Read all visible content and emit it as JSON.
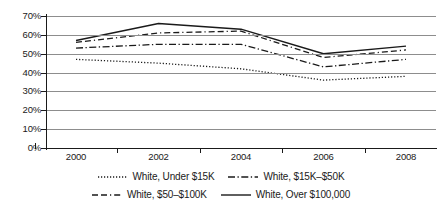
{
  "chart_data": {
    "type": "line",
    "title": "",
    "xlabel": "",
    "ylabel": "",
    "categories": [
      "2000",
      "2002",
      "2004",
      "2006",
      "2008"
    ],
    "x": [
      2000,
      2002,
      2004,
      2006,
      2008
    ],
    "ylim": [
      0,
      70
    ],
    "ytick_labels": [
      "0%",
      "10%",
      "20%",
      "30%",
      "40%",
      "50%",
      "60%",
      "70%"
    ],
    "ytick_values": [
      0,
      10,
      20,
      30,
      40,
      50,
      60,
      70
    ],
    "grid": true,
    "legend_position": "bottom",
    "series": [
      {
        "name": "White, Under $15K",
        "values": [
          47,
          45,
          42,
          36,
          38
        ],
        "style": "dotted",
        "color": "#1a1a1a"
      },
      {
        "name": "White, $15K–$50K",
        "values": [
          53,
          55,
          55,
          43,
          47
        ],
        "style": "dashdot",
        "color": "#1a1a1a"
      },
      {
        "name": "White, $50–$100K",
        "values": [
          56,
          61,
          62,
          48,
          52
        ],
        "style": "dashed",
        "color": "#1a1a1a"
      },
      {
        "name": "White, Over $100,000",
        "values": [
          57,
          66,
          63,
          50,
          54
        ],
        "style": "solid",
        "color": "#1a1a1a"
      }
    ]
  },
  "legend": {
    "items": [
      {
        "label": "White, Under $15K",
        "style": "dotted"
      },
      {
        "label": "White, $15K–$50K",
        "style": "dashdot"
      },
      {
        "label": "White, $50–$100K",
        "style": "dashed"
      },
      {
        "label": "White, Over $100,000",
        "style": "solid"
      }
    ]
  },
  "colors": {
    "line": "#1a1a1a",
    "grid": "#8d8d8d",
    "axis": "#1a1a1a",
    "background": "#ffffff"
  }
}
